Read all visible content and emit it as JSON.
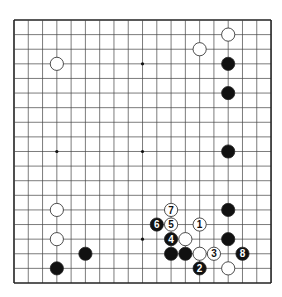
{
  "board": {
    "size": 19,
    "origin": [
      14,
      20
    ],
    "spacing": [
      14.28,
      14.61
    ],
    "line_color": "#444444",
    "border_color": "#222222",
    "star_points": [
      [
        9,
        3
      ],
      [
        3,
        9
      ],
      [
        9,
        9
      ],
      [
        9,
        15
      ]
    ],
    "stones": [
      {
        "color": "white",
        "col": 3,
        "row": 3
      },
      {
        "color": "white",
        "col": 13,
        "row": 2
      },
      {
        "color": "white",
        "col": 15,
        "row": 1
      },
      {
        "color": "black",
        "col": 15,
        "row": 3
      },
      {
        "color": "black",
        "col": 15,
        "row": 5
      },
      {
        "color": "black",
        "col": 15,
        "row": 9
      },
      {
        "color": "black",
        "col": 15,
        "row": 13
      },
      {
        "color": "black",
        "col": 15,
        "row": 15
      },
      {
        "color": "white",
        "col": 3,
        "row": 13
      },
      {
        "color": "white",
        "col": 3,
        "row": 15
      },
      {
        "color": "black",
        "col": 5,
        "row": 16
      },
      {
        "color": "black",
        "col": 3,
        "row": 17
      },
      {
        "color": "white",
        "col": 12,
        "row": 15
      },
      {
        "color": "black",
        "col": 11,
        "row": 16
      },
      {
        "color": "black",
        "col": 12,
        "row": 16
      },
      {
        "color": "white",
        "col": 13,
        "row": 16
      },
      {
        "color": "white",
        "col": 15,
        "row": 17
      },
      {
        "color": "white",
        "col": 13,
        "row": 14,
        "label": "1"
      },
      {
        "color": "black",
        "col": 13,
        "row": 17,
        "label": "2"
      },
      {
        "color": "white",
        "col": 14,
        "row": 16,
        "label": "3"
      },
      {
        "color": "black",
        "col": 11,
        "row": 15,
        "label": "4"
      },
      {
        "color": "white",
        "col": 11,
        "row": 14,
        "label": "5"
      },
      {
        "color": "black",
        "col": 10,
        "row": 14,
        "label": "6"
      },
      {
        "color": "white",
        "col": 11,
        "row": 13,
        "label": "7"
      },
      {
        "color": "black",
        "col": 16,
        "row": 16,
        "label": "8"
      }
    ]
  }
}
